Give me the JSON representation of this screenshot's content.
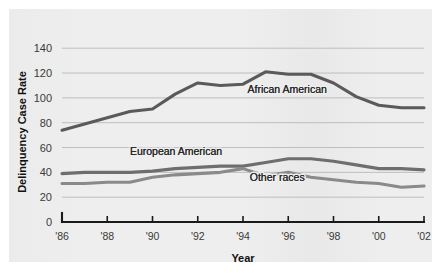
{
  "chart_data": {
    "type": "line",
    "title": "",
    "xlabel": "Year",
    "ylabel": "Delinquency Case Rate",
    "xlim": [
      1986,
      2002
    ],
    "ylim": [
      0,
      145
    ],
    "ytick_values": [
      0,
      20,
      40,
      60,
      80,
      100,
      120,
      140
    ],
    "ytick_labels": [
      "0",
      "20",
      "40",
      "60",
      "80",
      "100",
      "120",
      "140"
    ],
    "xtick_values": [
      1986,
      1988,
      1990,
      1992,
      1994,
      1996,
      1998,
      2000,
      2002
    ],
    "xtick_labels": [
      "'86",
      "'88",
      "'90",
      "'92",
      "'94",
      "'96",
      "'98",
      "'00",
      "'02"
    ],
    "grid": "horizontal",
    "gridline_values": [
      20,
      40,
      60,
      80,
      100,
      120,
      140
    ],
    "legend_position": "inline-annotations",
    "x": [
      1986,
      1987,
      1988,
      1989,
      1990,
      1991,
      1992,
      1993,
      1994,
      1995,
      1996,
      1997,
      1998,
      1999,
      2000,
      2001,
      2002
    ],
    "series": [
      {
        "name": "African American",
        "color": "#5a5a5a",
        "label_x": 1994.2,
        "label_y": 104,
        "values": [
          74,
          79,
          84,
          89,
          91,
          103,
          112,
          110,
          111,
          121,
          119,
          119,
          112,
          101,
          94,
          92,
          92
        ]
      },
      {
        "name": "European American",
        "color": "#6e6e6e",
        "label_x": 1989.0,
        "label_y": 54,
        "values": [
          39,
          40,
          40,
          40,
          41,
          43,
          44,
          45,
          45,
          48,
          51,
          51,
          49,
          46,
          43,
          43,
          42
        ]
      },
      {
        "name": "Other races",
        "color": "#8a8a8a",
        "label_x": 1994.3,
        "label_y": 33,
        "values": [
          31,
          31,
          32,
          32,
          36,
          38,
          39,
          40,
          43,
          37,
          40,
          36,
          34,
          32,
          31,
          28,
          29
        ]
      }
    ],
    "annotations": [
      {
        "text": "African American",
        "series": "African American"
      },
      {
        "text": "European American",
        "series": "European American"
      },
      {
        "text": "Other races",
        "series": "Other races"
      }
    ],
    "colors": {
      "panel_background": "#eeeeee",
      "page_background": "#ffffff",
      "gridline": "#b9b9b9",
      "axis": "#1a1a1a",
      "text": "#3a3a3a"
    }
  }
}
